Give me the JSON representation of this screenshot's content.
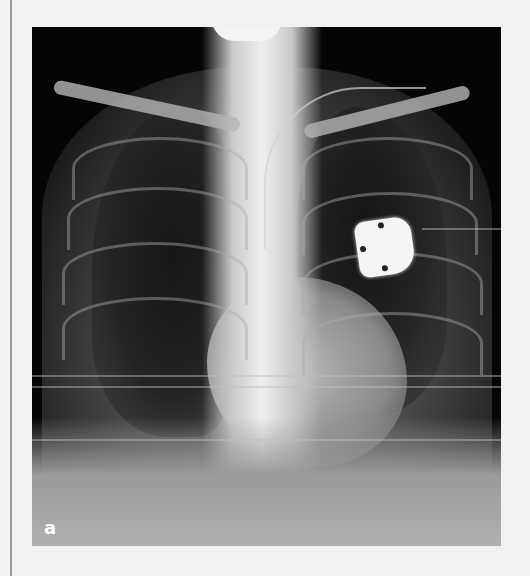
{
  "figure": {
    "panel_label": "a",
    "content": "chest-xray-frontal",
    "colors": {
      "page_background": "#f1f1f0",
      "image_background": "#050505",
      "label_color": "#ffffff",
      "margin_rule": "#9a9a9a"
    }
  }
}
